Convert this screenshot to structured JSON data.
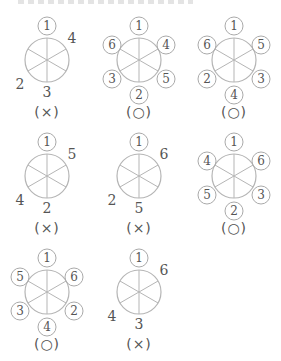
{
  "figures": [
    {
      "labels": {
        "top": "1",
        "ur": "4",
        "lr": "",
        "bottom": "3",
        "ll": "2",
        "ul": ""
      },
      "circled": {
        "top": true
      },
      "mark": "(×)"
    },
    {
      "labels": {
        "top": "1",
        "ur": "4",
        "lr": "5",
        "bottom": "2",
        "ll": "3",
        "ul": "6"
      },
      "circled": {
        "top": true,
        "ur": true,
        "lr": true,
        "bottom": true,
        "ll": true,
        "ul": true
      },
      "mark": "(○)"
    },
    {
      "labels": {
        "top": "1",
        "ur": "5",
        "lr": "3",
        "bottom": "4",
        "ll": "2",
        "ul": "6"
      },
      "circled": {
        "top": true,
        "ur": true,
        "lr": true,
        "bottom": true,
        "ll": true,
        "ul": true
      },
      "mark": "(○)"
    },
    {
      "labels": {
        "top": "1",
        "ur": "5",
        "lr": "",
        "bottom": "2",
        "ll": "4",
        "ul": ""
      },
      "circled": {
        "top": true
      },
      "mark": "(×)"
    },
    {
      "labels": {
        "top": "1",
        "ur": "6",
        "lr": "",
        "bottom": "5",
        "ll": "2",
        "ul": ""
      },
      "circled": {
        "top": true
      },
      "mark": "(×)"
    },
    {
      "labels": {
        "top": "1",
        "ur": "6",
        "lr": "3",
        "bottom": "2",
        "ll": "5",
        "ul": "4"
      },
      "circled": {
        "top": true,
        "ur": true,
        "lr": true,
        "bottom": true,
        "ll": true,
        "ul": true
      },
      "mark": "(○)"
    },
    {
      "labels": {
        "top": "1",
        "ur": "6",
        "lr": "2",
        "bottom": "4",
        "ll": "3",
        "ul": "5"
      },
      "circled": {
        "top": true,
        "ur": true,
        "lr": true,
        "bottom": true,
        "ll": true,
        "ul": true
      },
      "mark": "(○)"
    },
    {
      "labels": {
        "top": "1",
        "ur": "6",
        "lr": "",
        "bottom": "3",
        "ll": "4",
        "ul": ""
      },
      "circled": {
        "top": true
      },
      "mark": "(×)"
    }
  ],
  "colors": {
    "stroke": "#b5b5b5",
    "text": "#555555"
  }
}
